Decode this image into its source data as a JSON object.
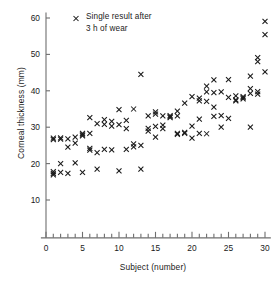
{
  "chart_data": {
    "type": "scatter",
    "title": "",
    "xlabel": "Subject (number)",
    "ylabel": "Corneal thickness (mm)",
    "xlim": [
      -0.7,
      30.8
    ],
    "ylim": [
      -0.4,
      61.5
    ],
    "xticks": [
      0,
      5,
      10,
      15,
      20,
      25,
      30
    ],
    "yticks": [
      10,
      20,
      30,
      40,
      50,
      60
    ],
    "xminor_step": 1,
    "grid": false,
    "marker": "x",
    "marker_color": "#1a1a1a",
    "legend": {
      "position": "top-left-inside",
      "entries": [
        {
          "marker": "x",
          "line1": "Single result after",
          "line2": "3 h of wear"
        }
      ]
    },
    "series": [
      {
        "name": "Single result after 3 h of wear",
        "points": [
          [
            1,
            27.0
          ],
          [
            1,
            26.6
          ],
          [
            1,
            17.8
          ],
          [
            1,
            17.3
          ],
          [
            1,
            16.9
          ],
          [
            2,
            27.1
          ],
          [
            2,
            26.7
          ],
          [
            2,
            20.0
          ],
          [
            2,
            17.6
          ],
          [
            3,
            26.8
          ],
          [
            3,
            24.5
          ],
          [
            3,
            17.3
          ],
          [
            4,
            27.3
          ],
          [
            4,
            25.6
          ],
          [
            4,
            20.2
          ],
          [
            5,
            28.3
          ],
          [
            5,
            27.9
          ],
          [
            5,
            27.6
          ],
          [
            5,
            17.6
          ],
          [
            6,
            32.6
          ],
          [
            6,
            28.3
          ],
          [
            6,
            24.2
          ],
          [
            6,
            23.7
          ],
          [
            7,
            31.0
          ],
          [
            7,
            23.0
          ],
          [
            7,
            18.5
          ],
          [
            8,
            32.1
          ],
          [
            8,
            30.8
          ],
          [
            8,
            23.9
          ],
          [
            9,
            31.6
          ],
          [
            9,
            30.3
          ],
          [
            9,
            23.8
          ],
          [
            10,
            34.8
          ],
          [
            10,
            30.7
          ],
          [
            10,
            18.0
          ],
          [
            11,
            31.9
          ],
          [
            11,
            29.6
          ],
          [
            11,
            23.9
          ],
          [
            12,
            35.0
          ],
          [
            12,
            25.4
          ],
          [
            12,
            24.6
          ],
          [
            13,
            44.5
          ],
          [
            13,
            25.0
          ],
          [
            13,
            18.5
          ],
          [
            14,
            33.1
          ],
          [
            14,
            29.7
          ],
          [
            14,
            28.9
          ],
          [
            15,
            34.2
          ],
          [
            15,
            33.6
          ],
          [
            15,
            30.2
          ],
          [
            15,
            27.3
          ],
          [
            16,
            33.1
          ],
          [
            16,
            30.6
          ],
          [
            16,
            29.6
          ],
          [
            17,
            33.2
          ],
          [
            17,
            32.9
          ],
          [
            17,
            32.6
          ],
          [
            18,
            34.4
          ],
          [
            18,
            33.1
          ],
          [
            18,
            28.3
          ],
          [
            18,
            28.0
          ],
          [
            19,
            36.6
          ],
          [
            19,
            28.6
          ],
          [
            19,
            28.3
          ],
          [
            20,
            38.4
          ],
          [
            20,
            30.3
          ],
          [
            20,
            27.0
          ],
          [
            21,
            38.0
          ],
          [
            21,
            37.2
          ],
          [
            21,
            32.2
          ],
          [
            21,
            28.3
          ],
          [
            22,
            41.3
          ],
          [
            22,
            39.7
          ],
          [
            22,
            37.1
          ],
          [
            22,
            28.2
          ],
          [
            23,
            43.0
          ],
          [
            23,
            39.5
          ],
          [
            23,
            35.5
          ],
          [
            23,
            33.0
          ],
          [
            24,
            39.7
          ],
          [
            24,
            33.2
          ],
          [
            24,
            30.0
          ],
          [
            25,
            43.1
          ],
          [
            25,
            38.2
          ],
          [
            25,
            32.4
          ],
          [
            26,
            38.6
          ],
          [
            26,
            37.5
          ],
          [
            26,
            37.2
          ],
          [
            27,
            38.4
          ],
          [
            27,
            38.1
          ],
          [
            27,
            37.8
          ],
          [
            28,
            44.0
          ],
          [
            28,
            40.6
          ],
          [
            28,
            39.3
          ],
          [
            28,
            30.0
          ],
          [
            29,
            49.1
          ],
          [
            29,
            48.0
          ],
          [
            29,
            39.8
          ],
          [
            29,
            39.1
          ],
          [
            30,
            59.1
          ],
          [
            30,
            55.4
          ],
          [
            30,
            45.2
          ]
        ]
      }
    ]
  }
}
